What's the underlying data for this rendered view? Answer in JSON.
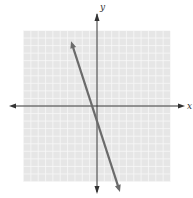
{
  "chart_data": {
    "type": "line",
    "title": "",
    "xlabel": "x",
    "ylabel": "y",
    "xlim": [
      -10,
      10
    ],
    "ylim": [
      -10,
      10
    ],
    "grid": true,
    "grid_step": 1,
    "series": [
      {
        "name": "line",
        "slope": -3,
        "intercept": -2,
        "x": [
          -3.4,
          3
        ],
        "y": [
          8.2,
          -11
        ]
      }
    ],
    "colors": {
      "grid_bg": "#e6e6e6",
      "grid_line": "#f7f7f7",
      "axis": "#333333",
      "line": "#6b6b6b"
    }
  }
}
